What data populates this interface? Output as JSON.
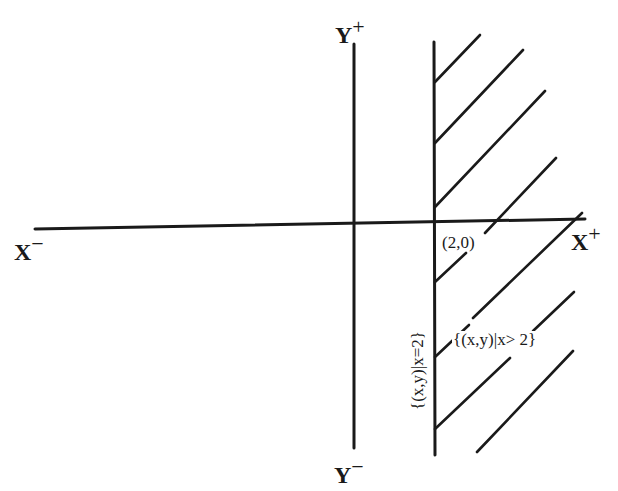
{
  "diagram": {
    "type": "coordinate-plane-region",
    "axes": {
      "x_neg_label": "X",
      "x_neg_sup": "−",
      "x_pos_label": "X",
      "x_pos_sup": "+",
      "y_pos_label": "Y",
      "y_pos_sup": "+",
      "y_neg_label": "Y",
      "y_neg_sup": "−"
    },
    "point_label": "(2,0)",
    "boundary_line_label": "{(x,y)|x=2}",
    "region_label": "{(x,y)|x> 2}",
    "colors": {
      "ink": "#1a1a1a",
      "background": "#ffffff"
    }
  }
}
